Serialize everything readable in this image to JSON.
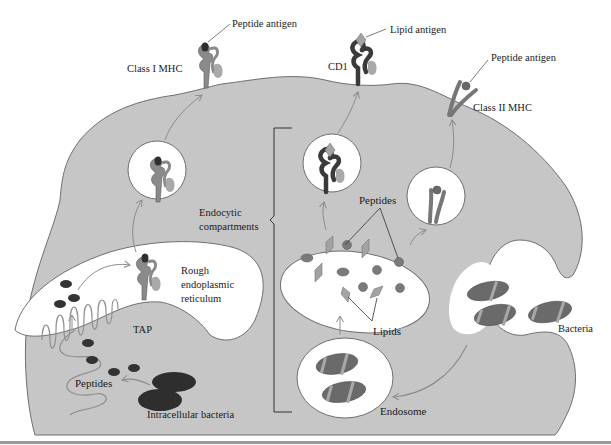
{
  "colors": {
    "cytoplasm": "#c6c6c6",
    "outline": "#6f6f6f",
    "dark_molecule": "#3a3a3a",
    "mid_molecule": "#8a8a8a",
    "light_molecule": "#a9a9a9",
    "vesicle": "#ffffff",
    "bacteria_body": "#6a6a6a",
    "bacteria_stripe": "#a8a8a8",
    "arrow": "#8c8c8c",
    "text": "#1a1a1a"
  },
  "labels": {
    "class1_peptide_antigen": "Peptide antigen",
    "class1_mhc": "Class I MHC",
    "lipid_antigen": "Lipid antigen",
    "cd1": "CD1",
    "class2_peptide_antigen": "Peptide antigen",
    "class2_mhc": "Class II MHC",
    "endocytic_line1": "Endocytic",
    "endocytic_line2": "compartments",
    "peptides_endocytic": "Peptides",
    "lipids": "Lipids",
    "rer_line1": "Rough",
    "rer_line2": "endoplasmic",
    "rer_line3": "reticulum",
    "tap": "TAP",
    "peptides_cytosol": "Peptides",
    "intracellular_bacteria": "Intracellular bacteria",
    "bacteria": "Bacteria",
    "endosome": "Endosome"
  }
}
